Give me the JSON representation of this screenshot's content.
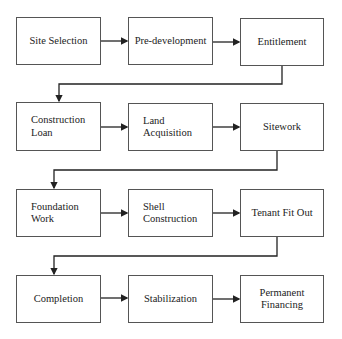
{
  "diagram": {
    "type": "flowchart",
    "rows": [
      [
        "Site Selection",
        "Pre-development",
        "Entitlement"
      ],
      [
        "Construction\nLoan",
        "Land\nAcquisition",
        "Sitework"
      ],
      [
        "Foundation\nWork",
        "Shell\nConstruction",
        "Tenant Fit Out"
      ],
      [
        "Completion",
        "Stabilization",
        "Permanent\nFinancing"
      ]
    ],
    "nodes": {
      "n1": "Site Selection",
      "n2": "Pre-development",
      "n3": "Entitlement",
      "n4": "Construction\nLoan",
      "n5": "Land\nAcquisition",
      "n6": "Sitework",
      "n7": "Foundation\nWork",
      "n8": "Shell\nConstruction",
      "n9": "Tenant Fit Out",
      "n10": "Completion",
      "n11": "Stabilization",
      "n12": "Permanent\nFinancing"
    },
    "edges": [
      [
        "n1",
        "n2"
      ],
      [
        "n2",
        "n3"
      ],
      [
        "n3",
        "n4"
      ],
      [
        "n4",
        "n5"
      ],
      [
        "n5",
        "n6"
      ],
      [
        "n6",
        "n7"
      ],
      [
        "n7",
        "n8"
      ],
      [
        "n8",
        "n9"
      ],
      [
        "n9",
        "n10"
      ],
      [
        "n10",
        "n11"
      ],
      [
        "n11",
        "n12"
      ]
    ],
    "colors": {
      "line": "#222222",
      "border": "#555555",
      "text": "#222222"
    }
  }
}
